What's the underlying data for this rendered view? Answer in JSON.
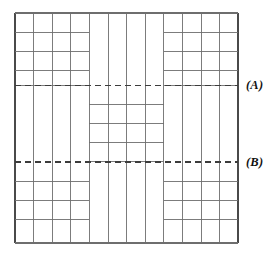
{
  "figure": {
    "title": "",
    "labels": {
      "a": "(A)",
      "b": "(B)"
    }
  },
  "chart_data": {
    "type": "diagram",
    "title": "",
    "grid": {
      "columns": 12,
      "rows": 12,
      "outer_box": {
        "x": 15,
        "y": 13,
        "width": 223,
        "height": 230
      },
      "vertical_line_x": [
        15,
        33.6,
        52.2,
        70.8,
        89.4,
        108,
        126.6,
        145.2,
        163.8,
        182.4,
        201,
        219.6,
        238
      ],
      "corner_block_rows": 4,
      "corner_block_cols": 4,
      "center_block": {
        "x0": 89.4,
        "x1": 163.8,
        "rows": 4
      }
    },
    "horizontal_lines": {
      "top_left_block": [
        13,
        32.2,
        51.4,
        70.6,
        85.5
      ],
      "top_right_block": [
        13,
        32.2,
        51.4,
        70.6,
        85.5
      ],
      "center_block": [
        104,
        123,
        142,
        161
      ],
      "bottom_left_block": [
        162,
        181.2,
        200.4,
        219.6,
        243
      ],
      "bottom_right_block": [
        162,
        181.2,
        200.4,
        219.6,
        243
      ]
    },
    "dashed_lines": [
      {
        "id": "A",
        "label": "(A)",
        "y": 85.5,
        "x_start": 15,
        "x_end": 238,
        "style": "dashed"
      },
      {
        "id": "B",
        "label": "(B)",
        "y": 162,
        "x_start": 15,
        "x_end": 238,
        "style": "dashed"
      }
    ],
    "colors": {
      "stroke": "#4a4a4a",
      "stroke_light": "#6e6e6e",
      "dash": "#3c3c3c",
      "background": "#ffffff",
      "label_text": "#111111"
    },
    "legend": [],
    "annotations": [
      "(A)",
      "(B)"
    ]
  }
}
